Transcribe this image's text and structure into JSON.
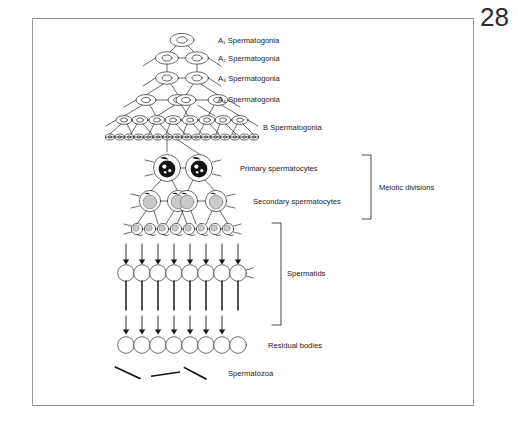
{
  "page": {
    "number": "28"
  },
  "figure": {
    "frame_color": "#9a9a9a",
    "ink_color": "#1a1a1a",
    "nucleus_gray": "#c9c9c9",
    "stages": [
      {
        "key": "a1",
        "label_main": "A",
        "label_sub": "1",
        "label_rest": " Spermatogonia",
        "cell_count": 1
      },
      {
        "key": "a2",
        "label_main": "A",
        "label_sub": "2",
        "label_rest": " Spermatogonia",
        "cell_count": 2
      },
      {
        "key": "a3",
        "label_main": "A",
        "label_sub": "3",
        "label_rest": " Spermatogonia",
        "cell_count": 2
      },
      {
        "key": "a4",
        "label_main": "A",
        "label_sub": "4",
        "label_rest": " Spermatogonia",
        "cell_count": 4
      },
      {
        "key": "b",
        "label_main": "B Spermatogonia",
        "label_sub": "",
        "label_rest": "",
        "cell_count": 8
      },
      {
        "key": "pre",
        "label_main": "",
        "label_sub": "",
        "label_rest": "",
        "cell_count": 16
      },
      {
        "key": "prim",
        "label_main": "Primary spermatocytes",
        "label_sub": "",
        "label_rest": "",
        "cell_count": 2
      },
      {
        "key": "sec",
        "label_main": "Secondary spermatocytes",
        "label_sub": "",
        "label_rest": "",
        "cell_count": 4
      },
      {
        "key": "early",
        "label_main": "",
        "label_sub": "",
        "label_rest": "",
        "cell_count": 8
      },
      {
        "key": "round",
        "label_main": "Spermatids",
        "label_sub": "",
        "label_rest": "",
        "cell_count": 8
      },
      {
        "key": "res",
        "label_main": "Residual bodies",
        "label_sub": "",
        "label_rest": "",
        "cell_count": 8
      },
      {
        "key": "spz",
        "label_main": "Spermatozoa",
        "label_sub": "",
        "label_rest": "",
        "cell_count": 3
      }
    ],
    "brackets": [
      {
        "key": "meiotic",
        "label": "Meiotic divisions"
      },
      {
        "key": "spermatids",
        "label": "Spermatids"
      }
    ],
    "labels": {
      "a1": "A₁ Spermatogonia",
      "a2": "A₂ Spermatogonia",
      "a3": "A₃ Spermatogonia",
      "a4": "A₄ Spermatogonia",
      "b": "B Spermatogonia",
      "primary": "Primary spermatocytes",
      "secondary": "Secondary spermatocytes",
      "spermatids": "Spermatids",
      "residual": "Residual bodies",
      "spermatozoa": "Spermatozoa",
      "meiotic": "Meiotic divisions"
    }
  }
}
